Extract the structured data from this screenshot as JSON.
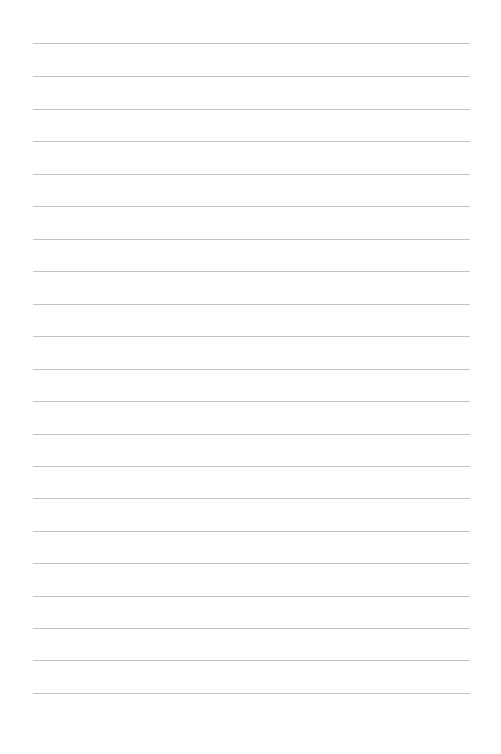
{
  "page": {
    "type": "lined-paper",
    "background_color": "#ffffff",
    "line_color": "#b8b8b8",
    "line_count": 21,
    "line_left_x": 33,
    "line_right_x": 470,
    "line_y_positions": [
      43,
      76,
      109,
      141,
      174,
      206,
      239,
      271,
      304,
      336,
      369,
      401,
      434,
      466,
      498,
      531,
      563,
      596,
      628,
      660,
      693
    ]
  }
}
